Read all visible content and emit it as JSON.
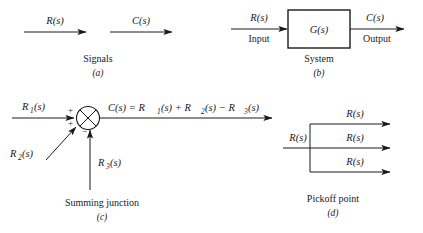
{
  "figure": {
    "ink_color": "#1a1a1a",
    "background_color": "#ffffff"
  },
  "panel_a": {
    "caption": "Signals",
    "letter": "(a)",
    "arrow1_label": "R(s)",
    "arrow2_label": "C(s)"
  },
  "panel_b": {
    "caption": "System",
    "letter": "(b)",
    "block_label": "G(s)",
    "input_signal": "R(s)",
    "input_label": "Input",
    "output_signal": "C(s)",
    "output_label": "Output"
  },
  "panel_c": {
    "caption": "Summing junction",
    "letter": "(c)",
    "input1": "R",
    "input1_sub": "1",
    "input1_suffix": "(s)",
    "input2": "R",
    "input2_sub": "2",
    "input2_suffix": "(s)",
    "input3": "R",
    "input3_sub": "3",
    "input3_suffix": "(s)",
    "sign1": "+",
    "sign2": "+",
    "sign3": "−",
    "equation_parts": {
      "lead": "C(s) = R",
      "s1": "1",
      "mid1": "(s) + R",
      "s2": "2",
      "mid2": "(s) − R",
      "s3": "3",
      "tail": "(s)"
    }
  },
  "panel_d": {
    "caption": "Pickoff point",
    "letter": "(d)",
    "input_label": "R(s)",
    "output_top": "R(s)",
    "output_mid": "R(s)",
    "output_bot": "R(s)"
  }
}
